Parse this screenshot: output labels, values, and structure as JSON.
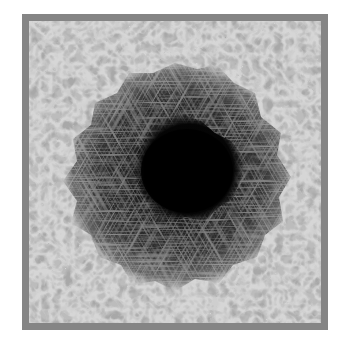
{
  "image": {
    "subject": "sunspot",
    "description": "Grayscale photograph of a solar sunspot: a dark central umbra surrounded by a filamentary penumbra, set within bright granulation cells, enclosed by a gray frame",
    "colors": {
      "frame": "#858585",
      "granulation_light": "#d8d8d8",
      "granulation_dark": "#6e6e6e",
      "penumbra": "#3a3a3a",
      "umbra": "#050505",
      "background": "#ffffff"
    }
  }
}
